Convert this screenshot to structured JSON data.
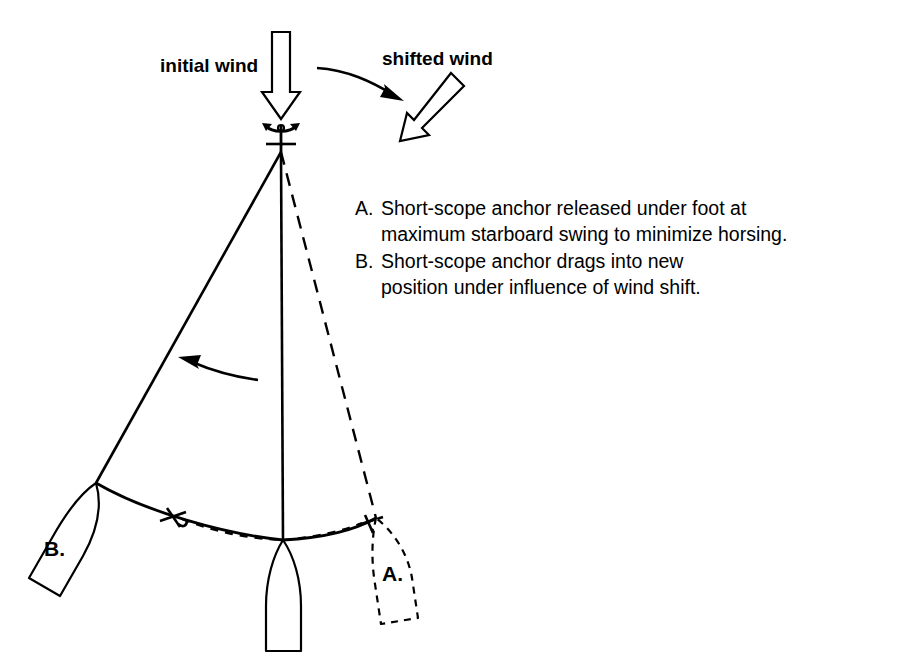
{
  "figure": {
    "background_color": "#ffffff",
    "ink_color": "#000000"
  },
  "wind": {
    "initial_label": "initial wind",
    "initial_direction": "down",
    "shifted_label": "shifted wind",
    "shifted_direction": "down-left",
    "shift_arrow": "curved-arrow-pointing-right-down"
  },
  "callout": {
    "items": [
      {
        "marker": "A.",
        "line1": "Short-scope anchor released under foot at",
        "line2": "maximum starboard swing to minimize horsing."
      },
      {
        "marker": "B.",
        "line1": "Short-scope anchor drags into new",
        "line2": "position under influence of wind shift."
      }
    ]
  },
  "boats": {
    "center": {
      "label": "",
      "style": "solid",
      "heading": "bow-up"
    },
    "port": {
      "label": "B.",
      "style": "solid",
      "heading": "bow-up-right"
    },
    "starboard": {
      "label": "A.",
      "style": "dashed",
      "heading": "bow-up-left"
    }
  },
  "rodes": {
    "port_rode": "solid",
    "center_rode": "solid",
    "starboard_rode": "dashed"
  },
  "swing_arrow": {
    "direction": "left",
    "style": "curved-solid-arrow"
  },
  "anchors": {
    "main": "anchor-symbol-at-apex",
    "chain_anchor_left": "anchor-symbol",
    "chain_anchor_right": "anchor-symbol",
    "chain_previous": "dashed",
    "chain_current": "solid"
  }
}
